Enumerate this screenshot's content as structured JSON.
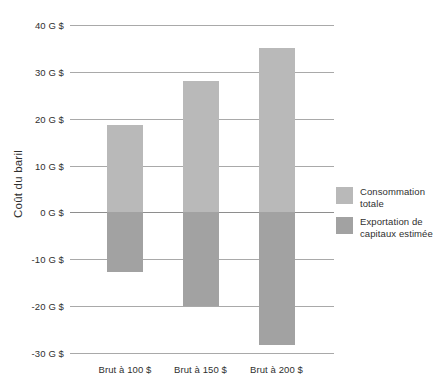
{
  "chart_data": {
    "type": "bar",
    "title": "",
    "subtitle": "",
    "xlabel": "",
    "ylabel": "Coût du baril",
    "categories": [
      "Brut à 100 $",
      "Brut à 150 $",
      "Brut à 200 $"
    ],
    "series": [
      {
        "name": "Consommation totale",
        "color": "#b9b9b9",
        "values": [
          18.7,
          28.0,
          35.1
        ]
      },
      {
        "name": "Exportation de capitaux estimée",
        "color": "#a2a2a2",
        "values": [
          -12.7,
          -19.9,
          -28.3
        ]
      }
    ],
    "ylim": [
      -30,
      40
    ],
    "yticks": [
      40,
      30,
      20,
      10,
      0,
      -10,
      -20,
      -30
    ],
    "ytick_labels": [
      "40 G $",
      "30 G $",
      "20 G $",
      "10 G $",
      "0 G $",
      "-10 G $",
      "-20 G $",
      "-30 G $"
    ],
    "grid": true,
    "legend_position": "right",
    "zero_line": 0,
    "units": "G $"
  },
  "legend": {
    "entries": [
      {
        "label": "Consommation totale",
        "color": "#b9b9b9"
      },
      {
        "label": "Exportation de capitaux estimée",
        "color": "#a2a2a2"
      }
    ]
  }
}
